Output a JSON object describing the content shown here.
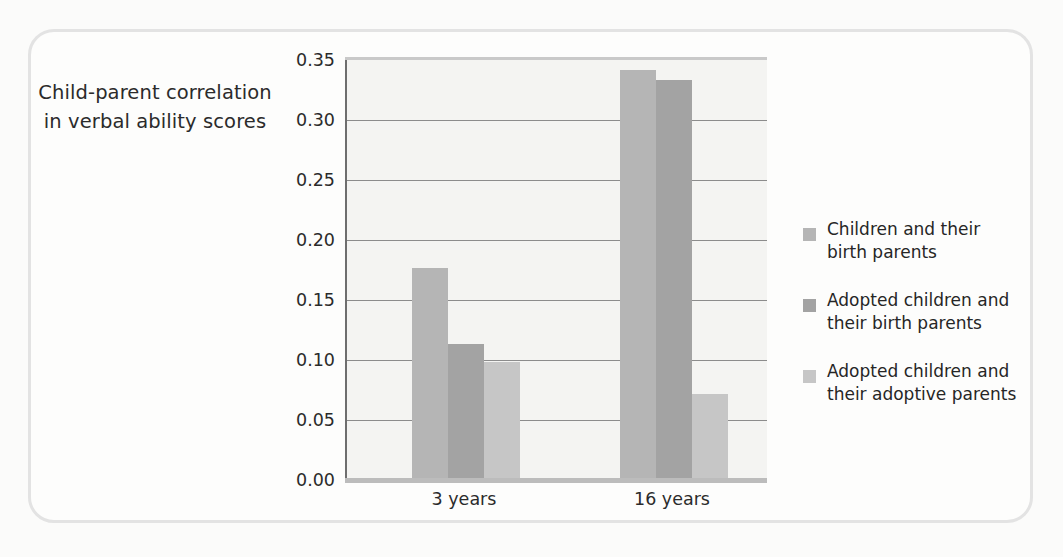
{
  "axis_title": {
    "line1": "Child-parent correlation",
    "line2": "in verbal ability scores"
  },
  "chart_data": {
    "type": "bar",
    "title": "",
    "xlabel": "",
    "ylabel": "Child-parent correlation in verbal ability scores",
    "categories": [
      "3 years",
      "16 years"
    ],
    "series": [
      {
        "name": "Children and their birth parents",
        "color": "#b5b5b5",
        "values": [
          0.177,
          0.342
        ]
      },
      {
        "name": "Adopted children and their birth parents",
        "color": "#a3a3a3",
        "values": [
          0.113,
          0.333
        ]
      },
      {
        "name": "Adopted children and their adoptive parents",
        "color": "#c6c6c6",
        "values": [
          0.098,
          0.072
        ]
      }
    ],
    "ylim": [
      0.0,
      0.35
    ],
    "ytick_values": [
      0.35,
      0.3,
      0.25,
      0.2,
      0.15,
      0.1,
      0.05,
      0.0
    ],
    "ytick_labels": [
      "0.35",
      "0.30",
      "0.25",
      "0.20",
      "0.15",
      "0.10",
      "0.05",
      "0.00"
    ],
    "grid": true,
    "legend_position": "right"
  },
  "legend": {
    "entries": [
      {
        "label": "Children and their\nbirth parents",
        "color": "#b5b5b5"
      },
      {
        "label": "Adopted children and\ntheir birth parents",
        "color": "#a3a3a3"
      },
      {
        "label": "Adopted children and\ntheir adoptive parents",
        "color": "#c6c6c6"
      }
    ]
  },
  "colors": {
    "frame_border": "#e3e3e3",
    "plot_background": "#f4f4f2",
    "axis_line": "#6e6e6e",
    "gridline": "#8c8c8c",
    "page_background": "#fbfbfa",
    "text": "#2b2b2b"
  }
}
